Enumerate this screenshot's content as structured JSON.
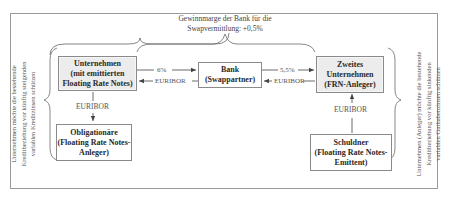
{
  "diagram": {
    "top_note": {
      "line1": "Gewinnmarge der Bank für die",
      "line2": "Swapvermittlung: +0,5%"
    },
    "boxes": {
      "company1": {
        "line1": "Unternehmen",
        "line2": "(mit emittierten",
        "line3": "Floating Rate Notes)"
      },
      "bank": {
        "line1": "Bank",
        "line2": "(Swappartner)"
      },
      "company2": {
        "line1": "Zweites",
        "line2": "Unternehmen",
        "line3": "(FRN-Anleger)"
      },
      "bondholders": {
        "line1": "Obligationäre",
        "line2": "(Floating Rate Notes-",
        "line3": "Anleger)"
      },
      "debtor": {
        "line1": "Schuldner",
        "line2": "(Floating Rate Notes-",
        "line3": "Emittent)"
      }
    },
    "flows": {
      "company1_to_bank": "6%",
      "bank_to_company1": "EURIBOR",
      "bank_to_company2": "5,5%",
      "company2_to_bank": "EURIBOR",
      "company1_to_bondholders": "EURIBOR",
      "debtor_to_company2": "EURIBOR"
    },
    "side_notes": {
      "left": {
        "line1": "Unternehmen möchte die bestehende",
        "line2": "Kreditbeziehung vor künftig steigenden",
        "line3": "variablen Kreditzinsen schützen"
      },
      "right": {
        "line1": "Unternehmen (Anleger) möchte die bestehende",
        "line2": "Kreditbeziehung vor künftig sinkenden",
        "line3": "variablen Guthabenzinsen  schützen"
      }
    },
    "colors": {
      "box_border": "#8a8a8a",
      "shaded_box_fill": "#ececec",
      "text": "#333333",
      "frame": "#9a9a9a"
    }
  }
}
